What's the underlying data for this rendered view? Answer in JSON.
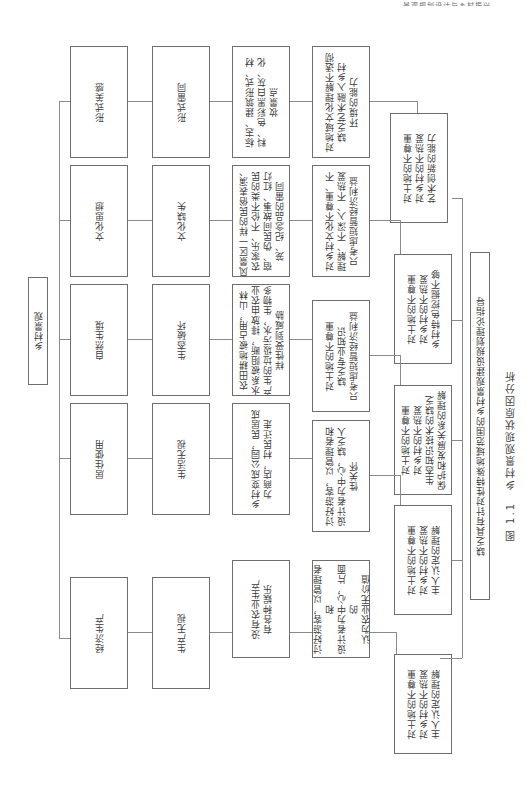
{
  "header": {
    "running_title": "景观规划设计与乡村振兴"
  },
  "root": {
    "label": "乡村景观"
  },
  "categories": [
    {
      "label": "形式美感"
    },
    {
      "label": "文化思想"
    },
    {
      "label": "自然生境"
    },
    {
      "label": "居住使用"
    },
    {
      "label": "经济生产"
    }
  ],
  "problems": [
    {
      "label": "形式雷同"
    },
    {
      "label": "文化缺失"
    },
    {
      "label": "生态破坏"
    },
    {
      "label": "生活无视"
    },
    {
      "label": "生产无视"
    }
  ],
  "phenomena": [
    {
      "text": "标志、建筑形式、材\n料、色彩黑白灰、化\n妆景点"
    },
    {
      "text": "风景区一样的民俗表演、\n农家乐、不伦不类的民\n宿、伪民间故事、红灯\n笼、纪念品的雷同"
    },
    {
      "text": "农田耕地被占用，山林\n水系被阻断，排放由农业\n产生的垃圾污水，生物多\n样性受到威胁"
    },
    {
      "text": "乡村变成公园，民居成\n为商店，村民迁走"
    },
    {
      "text": "没有农业生产\n有各种娱乐"
    }
  ],
  "causes_direct": [
    {
      "text": "对地域文化理解不透彻\n缺乏艺术融入乡村\n环境的能力"
    },
    {
      "text": "对乡村文化不尊重、不\n理解、不深入、不热爱\n只考虑短暂经济利益"
    },
    {
      "text": "对土地的不尊重\n缺乏专业知识\n只考虑短暂经济利益"
    },
    {
      "text": "讨好游客，以管理者和\n设计者为中心，缺乏人\n性关怀"
    },
    {
      "text": "讨好游客，以管理者和\n设计者为中心，片面的\n认为农业无价值"
    }
  ],
  "causes_root": [
    {
      "text": "对土地的不尊重\n对乡村的不热爱\n艺术创新的能力"
    },
    {
      "text": "对土地的不尊重\n对乡村的不热爱\n乡村特色挖掘不够"
    },
    {
      "text": "对土地的不尊重\n对乡村的不热爱\n生态知识技术的缺乏\n保护和发展关系的理解"
    },
    {
      "text": "对土地的不尊重\n对乡村的不热爱\n主人认定的理解"
    },
    {
      "text": "对土地的不尊重\n对乡村的不热爱\n主人认定的理解"
    }
  ],
  "conclusion": {
    "text": "缺乏具有针对性特殊地域范围的乡村景观建设规划理论指导"
  },
  "caption": {
    "text": "图 1.1　乡村景观现状原因分析"
  }
}
